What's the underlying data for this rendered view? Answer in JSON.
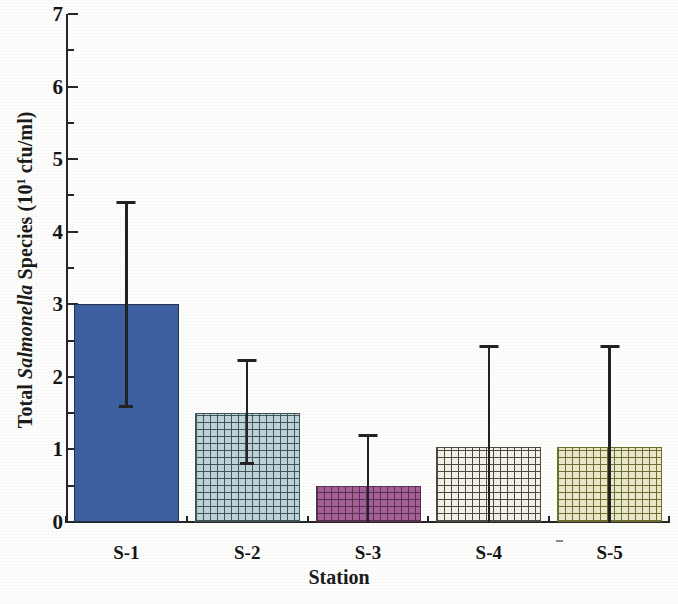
{
  "chart_data": {
    "type": "bar",
    "title": "",
    "xlabel": "Station",
    "ylabel_parts": {
      "pre": "Total ",
      "italic": "Salmonella",
      "post": " Species (10",
      "exponent": "1",
      "tail": " cfu/ml)"
    },
    "ylabel_plain": "Total Salmonella Species (10^1 cfu/ml)",
    "categories": [
      "S-1",
      "S-2",
      "S-3",
      "S-4",
      "S-5"
    ],
    "values": [
      3.0,
      1.5,
      0.5,
      1.03,
      1.03
    ],
    "error_upper": [
      4.43,
      2.25,
      1.21,
      2.44,
      2.44
    ],
    "error_lower": [
      1.57,
      0.78,
      0.0,
      0.0,
      0.0
    ],
    "ylim": [
      0,
      7
    ],
    "ymajor_ticks": [
      0,
      1,
      2,
      3,
      4,
      5,
      6,
      7
    ],
    "ytick_labels": [
      "0",
      "1",
      "2",
      "3",
      "4",
      "5",
      "6",
      "7"
    ],
    "yminor_ticks": [
      0.5,
      1.5,
      2.5,
      3.5,
      4.5,
      5.5,
      6.5
    ],
    "grid": false,
    "legend": "none",
    "bar_styles": [
      {
        "station": "S-1",
        "fill": "#3c5fa0",
        "pattern": "solid",
        "edge": "#24324f"
      },
      {
        "station": "S-2",
        "fill": "#bcd2d6",
        "pattern": "crosshatch",
        "edge": "#3e5458"
      },
      {
        "station": "S-3",
        "fill": "#a45f97",
        "pattern": "crosshatch",
        "edge": "#55304f"
      },
      {
        "station": "S-4",
        "fill": "#f2f0e6",
        "pattern": "crosshatch",
        "edge": "#4a4a42"
      },
      {
        "station": "S-5",
        "fill": "#e8e7c9",
        "pattern": "crosshatch",
        "edge": "#6d6d32"
      }
    ]
  }
}
